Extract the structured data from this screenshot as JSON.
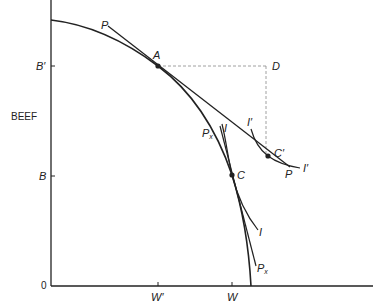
{
  "diagram": {
    "type": "production-possibility-frontier",
    "axes": {
      "y_label": "BEEF",
      "origin_label": "0",
      "y_ticks": [
        {
          "label": "B′",
          "y": 66
        },
        {
          "label": "B",
          "y": 176
        }
      ],
      "x_ticks": [
        {
          "label": "W′",
          "x": 158
        },
        {
          "label": "W",
          "x": 232
        }
      ]
    },
    "points": {
      "A": "A",
      "C": "C",
      "C_prime": "C′",
      "D": "D"
    },
    "lines": {
      "price_line_P_top": "P",
      "price_line_P_bottom": "P",
      "price_line_Px_top": "P",
      "price_line_Px_top_sub": "x",
      "price_line_Px_bottom": "P",
      "price_line_Px_bottom_sub": "x",
      "indifference_I_top": "I",
      "indifference_I_bottom": "I",
      "indifference_I_prime_top": "I′",
      "indifference_I_prime_bottom": "I′"
    },
    "colors": {
      "ink": "#222222",
      "dashed": "#888888",
      "background": "#ffffff"
    }
  }
}
